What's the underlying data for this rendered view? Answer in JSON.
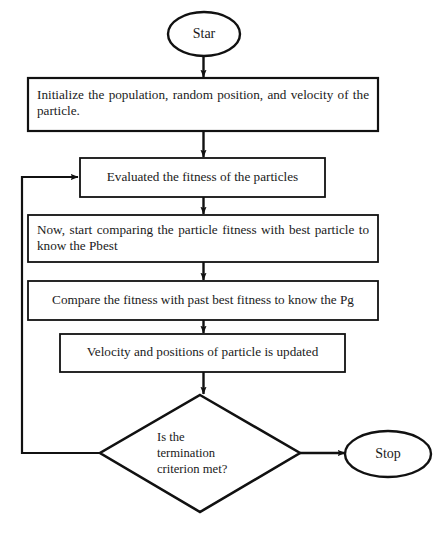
{
  "diagram": {
    "type": "flowchart",
    "stroke_color": "#111111",
    "fill_color": "#ffffff",
    "background_color": "#ffffff"
  },
  "nodes": {
    "start": {
      "shape": "ellipse",
      "label": "Star"
    },
    "initialize": {
      "shape": "process",
      "label": "Initialize the population, random position, and velocity of the particle."
    },
    "evaluate": {
      "shape": "process",
      "label": "Evaluated the fitness of the particles"
    },
    "compare_pbest": {
      "shape": "process",
      "label": "Now, start comparing the particle fitness with best particle to know the Pbest"
    },
    "compare_pg": {
      "shape": "process",
      "label": "Compare the fitness with past best fitness to know the Pg"
    },
    "update": {
      "shape": "process",
      "label": "Velocity and positions of particle is updated"
    },
    "decision": {
      "shape": "diamond",
      "label": "Is the\ntermination\ncriterion met?"
    },
    "stop": {
      "shape": "ellipse",
      "label": "Stop"
    }
  },
  "edges": [
    {
      "name": "start-to-initialize",
      "from": "start",
      "to": "initialize",
      "label": ""
    },
    {
      "name": "initialize-to-evaluate",
      "from": "initialize",
      "to": "evaluate",
      "label": ""
    },
    {
      "name": "evaluate-to-compare-pbest",
      "from": "evaluate",
      "to": "compare_pbest",
      "label": ""
    },
    {
      "name": "compare-pbest-to-compare-pg",
      "from": "compare_pbest",
      "to": "compare_pg",
      "label": ""
    },
    {
      "name": "compare-pg-to-update",
      "from": "compare_pg",
      "to": "update",
      "label": ""
    },
    {
      "name": "update-to-decision",
      "from": "update",
      "to": "decision",
      "label": ""
    },
    {
      "name": "decision-to-stop",
      "from": "decision",
      "to": "stop",
      "label": ""
    },
    {
      "name": "decision-loopback-to-evaluate",
      "from": "decision",
      "to": "evaluate",
      "label": ""
    }
  ],
  "caption": {
    "text": ""
  }
}
